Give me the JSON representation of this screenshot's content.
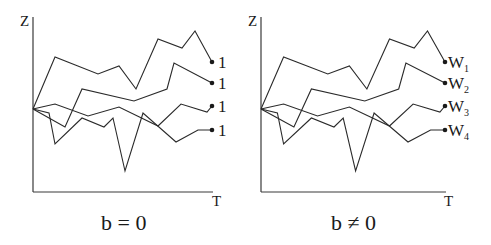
{
  "panels": [
    {
      "id": "left",
      "y_axis_label": "Z",
      "x_axis_label": "T",
      "caption": "b = 0",
      "end_labels": [
        {
          "main": "1",
          "sub": ""
        },
        {
          "main": "1",
          "sub": ""
        },
        {
          "main": "1",
          "sub": ""
        },
        {
          "main": "1",
          "sub": ""
        }
      ]
    },
    {
      "id": "right",
      "y_axis_label": "Z",
      "x_axis_label": "T",
      "caption": "b ≠ 0",
      "end_labels": [
        {
          "main": "W",
          "sub": "1"
        },
        {
          "main": "W",
          "sub": "2"
        },
        {
          "main": "W",
          "sub": "3"
        },
        {
          "main": "W",
          "sub": "4"
        }
      ]
    }
  ],
  "paths_left": [
    [
      [
        33,
        109
      ],
      [
        55,
        57
      ],
      [
        98,
        74
      ],
      [
        119,
        66
      ],
      [
        136,
        89
      ],
      [
        158,
        39
      ],
      [
        182,
        48
      ],
      [
        195,
        31
      ],
      [
        212,
        62
      ]
    ],
    [
      [
        33,
        109
      ],
      [
        65,
        127
      ],
      [
        82,
        89
      ],
      [
        134,
        101
      ],
      [
        167,
        89
      ],
      [
        174,
        63
      ],
      [
        212,
        83
      ]
    ],
    [
      [
        33,
        109
      ],
      [
        55,
        104
      ],
      [
        88,
        116
      ],
      [
        119,
        107
      ],
      [
        158,
        126
      ],
      [
        181,
        104
      ],
      [
        207,
        112
      ],
      [
        212,
        106
      ]
    ],
    [
      [
        33,
        109
      ],
      [
        49,
        113
      ],
      [
        55,
        144
      ],
      [
        82,
        118
      ],
      [
        104,
        127
      ],
      [
        113,
        118
      ],
      [
        125,
        171
      ],
      [
        143,
        113
      ],
      [
        176,
        142
      ],
      [
        198,
        130
      ],
      [
        212,
        130
      ]
    ]
  ],
  "colors": {
    "line": "#2a2a2a",
    "background": "#ffffff"
  }
}
